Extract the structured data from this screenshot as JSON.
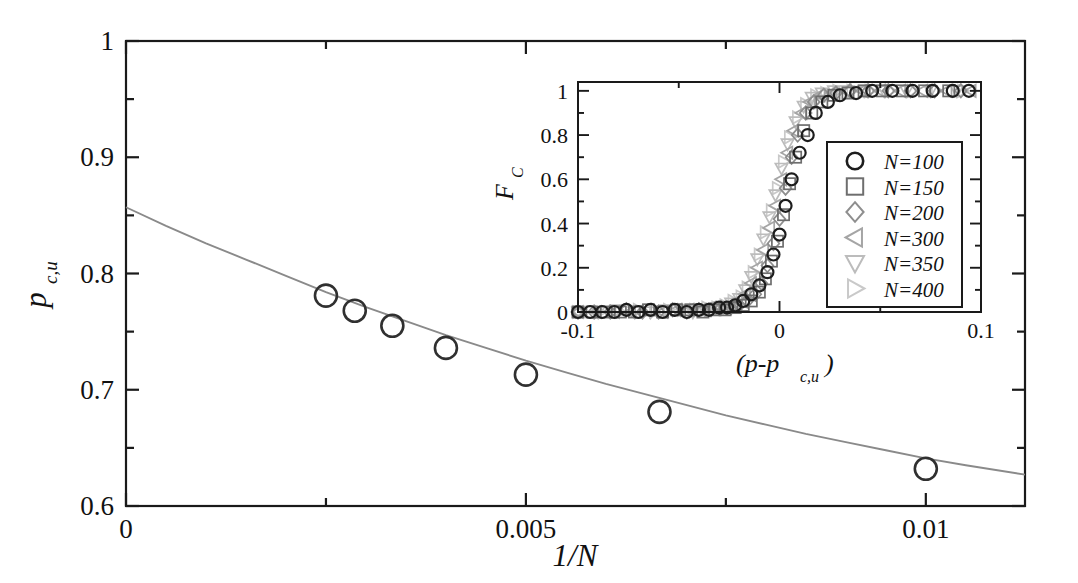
{
  "figure": {
    "background": "#ffffff",
    "ink": "#1a1a1a",
    "fit_color": "#8a8a8a"
  },
  "chart_data": [
    {
      "id": "main",
      "type": "scatter",
      "title": "",
      "xlabel": "1/N",
      "ylabel": "p_c,u",
      "ylabel_base": "p",
      "ylabel_sub": "c,u",
      "xlim": [
        0,
        0.01124
      ],
      "ylim": [
        0.6,
        1.0
      ],
      "grid": false,
      "legend_position": "none",
      "xticks": [
        0,
        0.005,
        0.01
      ],
      "xticklabels": [
        "0",
        "0.005",
        "0.01"
      ],
      "xminorticks": [
        0.0025,
        0.0075
      ],
      "yticks": [
        0.6,
        0.7,
        0.8,
        0.9,
        1.0
      ],
      "yticklabels": [
        "0.6",
        "0.7",
        "0.8",
        "0.9",
        "1"
      ],
      "yminorticks": [
        0.65,
        0.75,
        0.85,
        0.95
      ],
      "series": [
        {
          "name": "p_c,u data",
          "marker": "circle",
          "marker_color": "#303030",
          "x": [
            0.0025,
            0.00286,
            0.00333,
            0.004,
            0.005,
            0.00667,
            0.01
          ],
          "y": [
            0.781,
            0.768,
            0.755,
            0.736,
            0.713,
            0.681,
            0.632
          ]
        },
        {
          "name": "extrapolation fit",
          "marker": "none",
          "line_color": "#8a8a8a",
          "intercept": 0.857,
          "note": "smooth fit curve from 1/N=0 (p=0.857) down through data to right edge",
          "x": [
            0.0,
            0.0005,
            0.001,
            0.0015,
            0.002,
            0.0025,
            0.003,
            0.0035,
            0.004,
            0.0045,
            0.005,
            0.0055,
            0.006,
            0.0065,
            0.007,
            0.0075,
            0.008,
            0.0085,
            0.009,
            0.0095,
            0.01,
            0.0105,
            0.01124
          ],
          "y": [
            0.857,
            0.841,
            0.826,
            0.812,
            0.798,
            0.784,
            0.771,
            0.759,
            0.747,
            0.736,
            0.725,
            0.715,
            0.705,
            0.696,
            0.687,
            0.678,
            0.67,
            0.662,
            0.655,
            0.648,
            0.641,
            0.635,
            0.627
          ]
        }
      ]
    },
    {
      "id": "inset",
      "type": "scatter",
      "title": "",
      "xlabel": "(p-p_c,u)",
      "xlabel_parts": [
        "(p-p",
        "c,u",
        ")"
      ],
      "ylabel": "F_C",
      "ylabel_base": "F",
      "ylabel_sub": "C",
      "xlim": [
        -0.1,
        0.1
      ],
      "ylim": [
        0.0,
        1.04
      ],
      "grid": false,
      "legend_position": "lower-right-inside",
      "xticks": [
        -0.1,
        0.0,
        0.1
      ],
      "xticklabels": [
        "-0.1",
        "0",
        "0.1"
      ],
      "xminorticks": [
        -0.05,
        0.05
      ],
      "yticks": [
        0,
        0.2,
        0.4,
        0.6,
        0.8,
        1.0
      ],
      "yticklabels": [
        "0",
        "0.2",
        "0.4",
        "0.6",
        "0.8",
        "1"
      ],
      "yminorticks": [
        0.1,
        0.3,
        0.5,
        0.7,
        0.9
      ],
      "legend": [
        {
          "label": "N=100",
          "N": 100,
          "marker": "circle",
          "color": "#1d1d1d"
        },
        {
          "label": "N=150",
          "N": 150,
          "marker": "square",
          "color": "#6e6e6e"
        },
        {
          "label": "N=200",
          "N": 200,
          "marker": "diamond",
          "color": "#8e8e8e"
        },
        {
          "label": "N=300",
          "N": 300,
          "marker": "triangle-left",
          "color": "#a5a5a5"
        },
        {
          "label": "N=350",
          "N": 350,
          "marker": "triangle-down",
          "color": "#bcbcbc"
        },
        {
          "label": "N=400",
          "N": 400,
          "marker": "triangle-right",
          "color": "#c9c9c9"
        }
      ],
      "series": [
        {
          "name": "N=100",
          "marker": "circle",
          "color": "#1d1d1d",
          "x": [
            -0.1,
            -0.094,
            -0.088,
            -0.082,
            -0.076,
            -0.07,
            -0.064,
            -0.058,
            -0.052,
            -0.046,
            -0.04,
            -0.035,
            -0.03,
            -0.026,
            -0.022,
            -0.018,
            -0.014,
            -0.01,
            -0.006,
            -0.003,
            0.0,
            0.003,
            0.006,
            0.01,
            0.014,
            0.018,
            0.024,
            0.03,
            0.038,
            0.046,
            0.056,
            0.066,
            0.076,
            0.086,
            0.094
          ],
          "y": [
            0.0,
            0.0,
            0.0,
            0.0,
            0.01,
            0.0,
            0.01,
            0.0,
            0.01,
            0.0,
            0.01,
            0.01,
            0.02,
            0.02,
            0.03,
            0.05,
            0.08,
            0.12,
            0.18,
            0.26,
            0.35,
            0.48,
            0.6,
            0.72,
            0.8,
            0.9,
            0.95,
            0.98,
            0.99,
            1.0,
            1.0,
            1.0,
            1.0,
            1.0,
            1.0
          ]
        },
        {
          "name": "N=150",
          "marker": "square",
          "color": "#6e6e6e",
          "x": [
            -0.1,
            -0.093,
            -0.086,
            -0.079,
            -0.072,
            -0.065,
            -0.058,
            -0.051,
            -0.044,
            -0.038,
            -0.032,
            -0.027,
            -0.022,
            -0.018,
            -0.014,
            -0.01,
            -0.007,
            -0.004,
            -0.001,
            0.002,
            0.005,
            0.008,
            0.012,
            0.016,
            0.021,
            0.027,
            0.034,
            0.042,
            0.051,
            0.061,
            0.072,
            0.084
          ],
          "y": [
            0.0,
            0.0,
            0.0,
            0.0,
            0.0,
            0.01,
            0.0,
            0.01,
            0.01,
            0.0,
            0.01,
            0.01,
            0.02,
            0.03,
            0.05,
            0.09,
            0.15,
            0.23,
            0.32,
            0.44,
            0.58,
            0.7,
            0.82,
            0.9,
            0.95,
            0.98,
            0.99,
            1.0,
            1.0,
            1.0,
            1.0,
            1.0
          ]
        },
        {
          "name": "N=200",
          "marker": "diamond",
          "color": "#8e8e8e",
          "x": [
            -0.1,
            -0.092,
            -0.084,
            -0.076,
            -0.068,
            -0.06,
            -0.053,
            -0.046,
            -0.04,
            -0.034,
            -0.029,
            -0.024,
            -0.02,
            -0.016,
            -0.012,
            -0.009,
            -0.006,
            -0.003,
            0.0,
            0.003,
            0.006,
            0.009,
            0.013,
            0.017,
            0.022,
            0.028,
            0.035,
            0.044,
            0.054,
            0.065,
            0.077,
            0.09
          ],
          "y": [
            0.0,
            0.0,
            0.0,
            0.01,
            0.0,
            0.0,
            0.01,
            0.0,
            0.01,
            0.01,
            0.02,
            0.02,
            0.03,
            0.05,
            0.08,
            0.13,
            0.21,
            0.31,
            0.42,
            0.56,
            0.7,
            0.8,
            0.9,
            0.95,
            0.98,
            0.99,
            1.0,
            1.0,
            1.0,
            1.0,
            1.0,
            1.0
          ]
        },
        {
          "name": "N=300",
          "marker": "triangle-left",
          "color": "#a5a5a5",
          "x": [
            -0.1,
            -0.091,
            -0.082,
            -0.074,
            -0.066,
            -0.058,
            -0.051,
            -0.045,
            -0.039,
            -0.034,
            -0.029,
            -0.025,
            -0.021,
            -0.017,
            -0.014,
            -0.011,
            -0.008,
            -0.005,
            -0.002,
            0.001,
            0.004,
            0.007,
            0.011,
            0.015,
            0.02,
            0.026,
            0.033,
            0.041,
            0.05,
            0.06,
            0.071,
            0.083,
            0.095
          ],
          "y": [
            0.0,
            0.0,
            0.0,
            0.0,
            0.01,
            0.0,
            0.01,
            0.01,
            0.01,
            0.02,
            0.02,
            0.03,
            0.05,
            0.08,
            0.13,
            0.2,
            0.28,
            0.38,
            0.48,
            0.6,
            0.72,
            0.82,
            0.9,
            0.95,
            0.98,
            0.99,
            1.0,
            1.0,
            1.0,
            1.0,
            1.0,
            1.0,
            1.0
          ]
        },
        {
          "name": "N=350",
          "marker": "triangle-down",
          "color": "#bcbcbc",
          "x": [
            -0.1,
            -0.09,
            -0.081,
            -0.072,
            -0.064,
            -0.056,
            -0.049,
            -0.043,
            -0.037,
            -0.032,
            -0.028,
            -0.024,
            -0.02,
            -0.017,
            -0.014,
            -0.011,
            -0.008,
            -0.005,
            -0.002,
            0.001,
            0.004,
            0.008,
            0.012,
            0.016,
            0.021,
            0.027,
            0.034,
            0.042,
            0.052,
            0.063,
            0.075,
            0.088
          ],
          "y": [
            0.0,
            0.0,
            0.01,
            0.0,
            0.0,
            0.01,
            0.01,
            0.0,
            0.01,
            0.02,
            0.02,
            0.04,
            0.06,
            0.1,
            0.16,
            0.24,
            0.33,
            0.43,
            0.53,
            0.65,
            0.76,
            0.86,
            0.93,
            0.97,
            0.99,
            1.0,
            1.0,
            1.0,
            1.0,
            1.0,
            1.0,
            1.0
          ]
        },
        {
          "name": "N=400",
          "marker": "triangle-right",
          "color": "#c9c9c9",
          "x": [
            -0.1,
            -0.089,
            -0.079,
            -0.07,
            -0.062,
            -0.055,
            -0.048,
            -0.042,
            -0.036,
            -0.031,
            -0.027,
            -0.023,
            -0.019,
            -0.016,
            -0.013,
            -0.01,
            -0.007,
            -0.004,
            -0.001,
            0.002,
            0.005,
            0.009,
            0.013,
            0.018,
            0.023,
            0.029,
            0.036,
            0.045,
            0.055,
            0.066,
            0.078,
            0.091
          ],
          "y": [
            0.0,
            0.0,
            0.0,
            0.01,
            0.0,
            0.01,
            0.01,
            0.01,
            0.02,
            0.02,
            0.03,
            0.05,
            0.07,
            0.11,
            0.18,
            0.26,
            0.36,
            0.46,
            0.56,
            0.68,
            0.79,
            0.88,
            0.94,
            0.98,
            0.99,
            1.0,
            1.0,
            1.0,
            1.0,
            1.0,
            1.0,
            1.0
          ]
        }
      ]
    }
  ]
}
